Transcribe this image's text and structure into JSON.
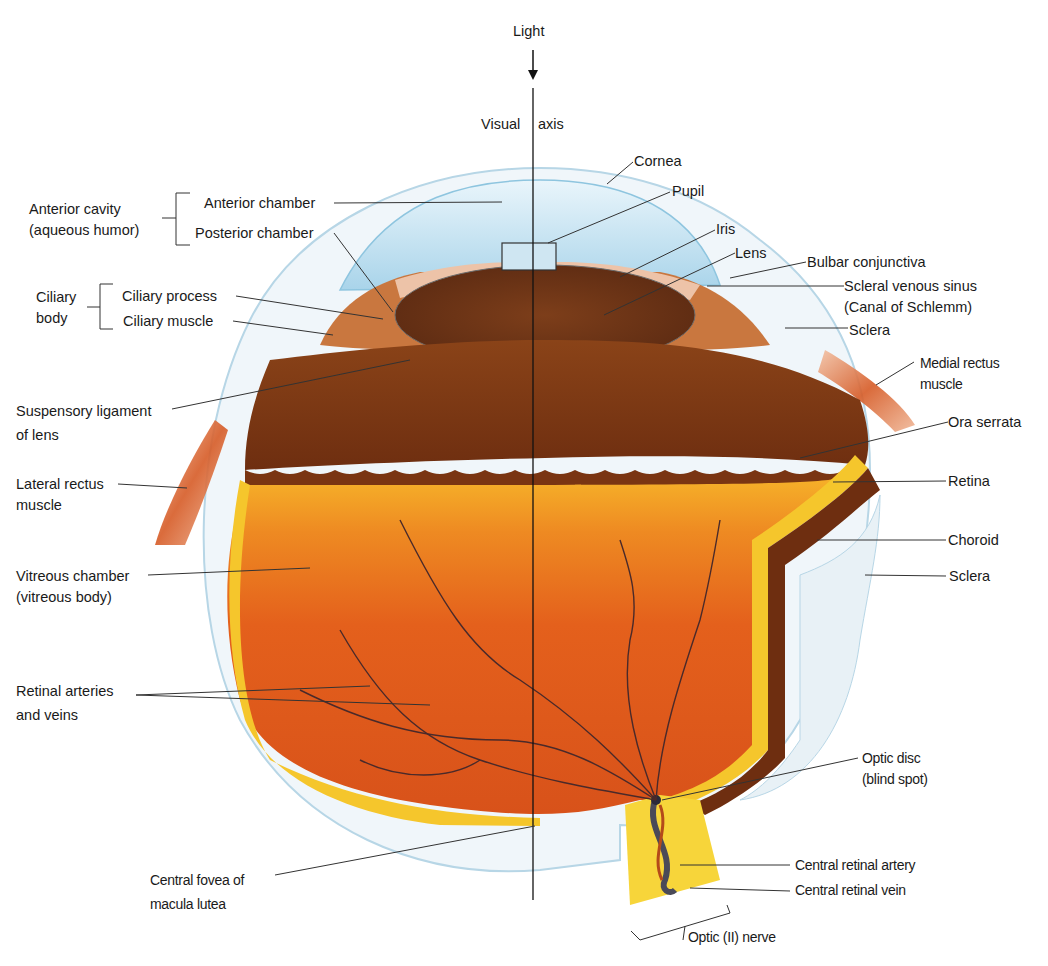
{
  "diagram": {
    "top": {
      "light": "Light",
      "visual_axis_left": "Visual",
      "visual_axis_right": "axis"
    },
    "left_labels": {
      "anterior_cavity": {
        "line1": "Anterior cavity",
        "line2": "(aqueous humor)"
      },
      "anterior_chamber": "Anterior chamber",
      "posterior_chamber": "Posterior chamber",
      "ciliary_body": {
        "line1": "Ciliary",
        "line2": "body"
      },
      "ciliary_process": "Ciliary process",
      "ciliary_muscle": "Ciliary muscle",
      "suspensory_ligament": {
        "line1": "Suspensory ligament",
        "line2": "of lens"
      },
      "lateral_rectus": {
        "line1": "Lateral rectus",
        "line2": "muscle"
      },
      "vitreous_chamber": {
        "line1": "Vitreous chamber",
        "line2": "(vitreous body)"
      },
      "retinal_vessels": {
        "line1": "Retinal arteries",
        "line2": "and veins"
      },
      "central_fovea": {
        "line1": "Central fovea of",
        "line2": "macula lutea"
      }
    },
    "right_labels": {
      "cornea": "Cornea",
      "pupil": "Pupil",
      "iris": "Iris",
      "lens": "Lens",
      "bulbar_conjunctiva": "Bulbar conjunctiva",
      "scleral_venous_sinus": {
        "line1": "Scleral venous sinus",
        "line2": "(Canal of Schlemm)"
      },
      "sclera_upper": "Sclera",
      "medial_rectus": {
        "line1": "Medial rectus",
        "line2": "muscle"
      },
      "ora_serrata": "Ora serrata",
      "retina": "Retina",
      "choroid": "Choroid",
      "sclera_lower": "Sclera",
      "optic_disc": {
        "line1": "Optic disc",
        "line2": "(blind spot)"
      },
      "central_retinal_artery": "Central retinal artery",
      "central_retinal_vein": "Central retinal vein",
      "optic_nerve": "Optic (II) nerve"
    },
    "colors": {
      "vitreous": "#e2571b",
      "choroid": "#7a3512",
      "retina": "#f5c62c",
      "sclera": "#e8f1f6",
      "cornea": "#bfe0f0",
      "muscle": "#d45a2a",
      "optic_nerve": "#f7d53a",
      "vessel": "#3a2a3a"
    }
  }
}
